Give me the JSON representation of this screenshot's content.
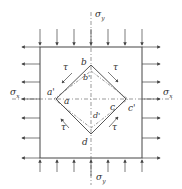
{
  "diagram": {
    "type": "stress-element-pure-shear",
    "labels": {
      "sigma_y_top": "σ",
      "sigma_y_top_sub": "y",
      "sigma_y_bottom": "σ",
      "sigma_y_bottom_sub": "y",
      "sigma_x_left": "σ",
      "sigma_x_left_sub": "x",
      "sigma_x_right": "σ",
      "sigma_x_right_sub": "x",
      "a": "a",
      "a_prime": "a'",
      "b": "b",
      "b_prime": "b'",
      "c": "c",
      "c_prime": "c'",
      "d": "d",
      "d_prime": "d'",
      "tau_tl": "τ",
      "tau_tr": "τ",
      "tau_bl": "τ",
      "tau_br": "τ"
    },
    "colors": {
      "line": "#444444",
      "background": "#ffffff"
    }
  }
}
